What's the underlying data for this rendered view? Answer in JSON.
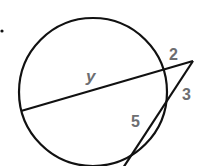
{
  "diagram": {
    "type": "geometry-secants",
    "labels": {
      "y": "y",
      "two": "2",
      "three": "3",
      "five": "5"
    },
    "colors": {
      "stroke": "#111111",
      "label": "#6d6e71",
      "background": "#ffffff"
    }
  }
}
